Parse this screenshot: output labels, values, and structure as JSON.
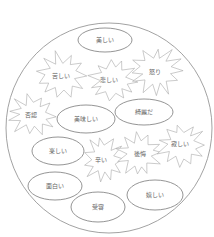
{
  "diagram": {
    "type": "emotion-word-map",
    "container": "circle",
    "legend": {
      "ellipse": "positive",
      "starburst": "negative"
    },
    "colors": {
      "outline": "#8a8a8a",
      "text": "#666666",
      "background": "#ffffff"
    },
    "nodes": [
      {
        "shape": "ellipse",
        "label": "美しい"
      },
      {
        "shape": "starburst",
        "label": "苦しい"
      },
      {
        "shape": "starburst",
        "label": "悲しい"
      },
      {
        "shape": "starburst",
        "label": "怒り"
      },
      {
        "shape": "starburst",
        "label": "否認"
      },
      {
        "shape": "ellipse",
        "label": "美味しい"
      },
      {
        "shape": "ellipse",
        "label": "綺麗だ"
      },
      {
        "shape": "ellipse",
        "label": "楽しい"
      },
      {
        "shape": "starburst",
        "label": "辛い"
      },
      {
        "shape": "starburst",
        "label": "後悔"
      },
      {
        "shape": "starburst",
        "label": "寂しい"
      },
      {
        "shape": "ellipse",
        "label": "面白い"
      },
      {
        "shape": "ellipse",
        "label": "受容"
      },
      {
        "shape": "ellipse",
        "label": "嬉しい"
      }
    ]
  }
}
